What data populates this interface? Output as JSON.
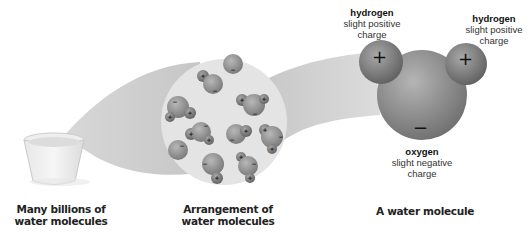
{
  "captions": {
    "beaker": [
      "Many billions of",
      "water molecules"
    ],
    "arrangement": [
      "Arrangement of",
      "water molecules"
    ],
    "molecule": "A water molecule"
  },
  "atom_labels": {
    "hydrogen_left": {
      "name": "hydrogen",
      "line1": "slight positive",
      "line2": "charge"
    },
    "hydrogen_right": {
      "name": "hydrogen",
      "line1": "slight positive",
      "line2": "charge"
    },
    "oxygen": {
      "name": "oxygen",
      "line1": "slight negative",
      "line2": "charge"
    }
  },
  "charges": {
    "positive": "+",
    "negative": "−"
  },
  "colors": {
    "beam": "#c8c8c8",
    "circle": "#e3e3e3",
    "atom": "#8a8a8a"
  }
}
